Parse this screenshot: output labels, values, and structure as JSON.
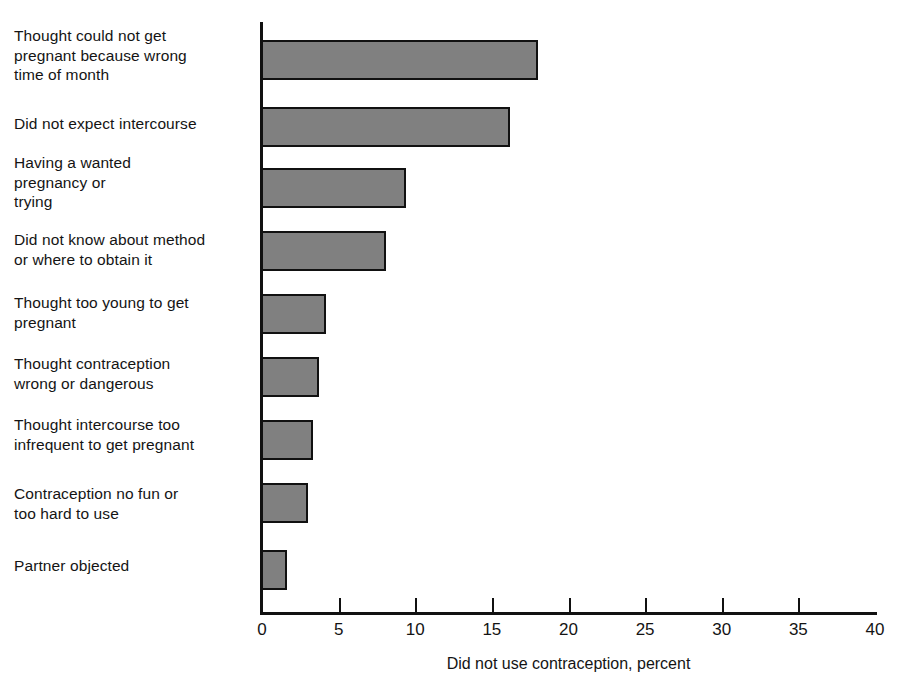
{
  "chart_data": {
    "type": "bar",
    "orientation": "horizontal",
    "title": "",
    "xlabel": "Did not use contraception, percent",
    "ylabel": "",
    "xlim": [
      0,
      40
    ],
    "xticks": [
      0,
      5,
      10,
      15,
      20,
      25,
      30,
      35,
      40
    ],
    "grid": false,
    "legend": "none",
    "bar_fill_color": "#808080",
    "bar_edge_color": "#111111",
    "axis_color": "#111111",
    "categories": [
      "Thought could not get\npregnant because wrong\ntime of month",
      "Did not expect intercourse",
      "Having a wanted\npregnancy or\ntrying",
      "Did not know about method\nor where to obtain it",
      "Thought too young to get\npregnant",
      "Thought contraception\nwrong or dangerous",
      "Thought intercourse too\ninfrequent to get pregnant",
      "Contraception no fun or\ntoo hard to use",
      "Partner objected"
    ],
    "values": [
      18.0,
      16.2,
      9.4,
      8.1,
      4.2,
      3.7,
      3.3,
      3.0,
      1.6
    ]
  }
}
